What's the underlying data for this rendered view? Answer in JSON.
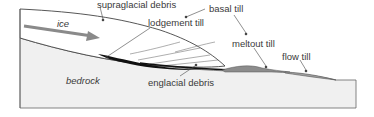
{
  "diagram": {
    "labels": {
      "ice": "ice",
      "bedrock": "bedrock",
      "supraglacial_debris": "supraglacial debris",
      "lodgement_till": "lodgement till",
      "basal_till": "basal till",
      "meltout_till": "meltout till",
      "flow_till": "flow till",
      "englacial_debris": "englacial debris"
    },
    "colors": {
      "ice": "#ffffff",
      "bedrock": "#f0f0f0",
      "outline": "#555555",
      "arrow": "#8a8a8a",
      "lodgement_till": "#111111",
      "meltout_till": "#8c8c8c",
      "flow_till": "#a0a0a0",
      "text": "#3a3a3a"
    }
  }
}
